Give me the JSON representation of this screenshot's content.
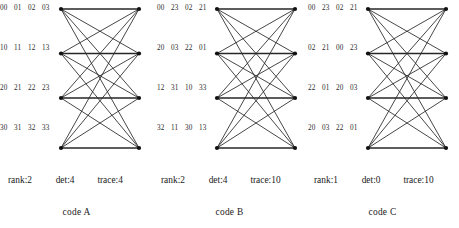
{
  "figure": {
    "type": "diagram"
  },
  "panels": [
    {
      "id": "code-a",
      "name": "code A",
      "matrix": [
        [
          "00",
          "01",
          "02",
          "03"
        ],
        [
          "10",
          "11",
          "12",
          "13"
        ],
        [
          "20",
          "21",
          "22",
          "23"
        ],
        [
          "30",
          "31",
          "32",
          "33"
        ]
      ],
      "stats": {
        "rank": "rank:2",
        "det": "det:4",
        "trace": "trace:4"
      },
      "graph": {
        "left_nodes": 4,
        "right_nodes": 4,
        "edges": 16,
        "complete_bipartite": true
      }
    },
    {
      "id": "code-b",
      "name": "code B",
      "matrix": [
        [
          "00",
          "23",
          "02",
          "21"
        ],
        [
          "20",
          "03",
          "22",
          "01"
        ],
        [
          "12",
          "31",
          "10",
          "33"
        ],
        [
          "32",
          "11",
          "30",
          "13"
        ]
      ],
      "stats": {
        "rank": "rank:2",
        "det": "det:4",
        "trace": "trace:10"
      },
      "graph": {
        "left_nodes": 4,
        "right_nodes": 4,
        "edges": 16,
        "complete_bipartite": true
      }
    },
    {
      "id": "code-c",
      "name": "code C",
      "matrix": [
        [
          "00",
          "23",
          "02",
          "21"
        ],
        [
          "02",
          "21",
          "00",
          "23"
        ],
        [
          "22",
          "01",
          "20",
          "03"
        ],
        [
          "20",
          "03",
          "22",
          "01"
        ]
      ],
      "stats": {
        "rank": "rank:1",
        "det": "det:0",
        "trace": "trace:10"
      },
      "graph": {
        "left_nodes": 4,
        "right_nodes": 4,
        "edges": 16,
        "complete_bipartite": true
      }
    }
  ],
  "colors": {
    "background": "#ffffff",
    "ink": "#1a1a1a",
    "edge": "#262626",
    "node": "#111111",
    "code_text": "#2b2b2b"
  }
}
